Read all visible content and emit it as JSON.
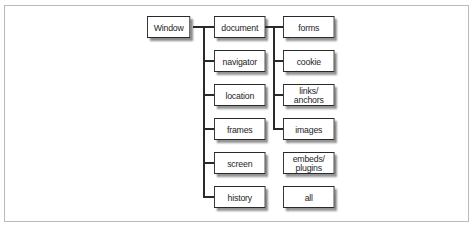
{
  "diagram": {
    "root": {
      "label": "Window"
    },
    "window_children": [
      {
        "label": "document"
      },
      {
        "label": "navigator"
      },
      {
        "label": "location"
      },
      {
        "label": "frames"
      },
      {
        "label": "screen"
      },
      {
        "label": "history"
      }
    ],
    "document_children": [
      {
        "label": "forms",
        "connected": true
      },
      {
        "label": "cookie",
        "connected": true
      },
      {
        "label": "links/\nanchors",
        "line1": "links/",
        "line2": "anchors",
        "connected": true
      },
      {
        "label": "images",
        "connected": true
      },
      {
        "label": "embeds/\nplugins",
        "line1": "embeds/",
        "line2": "plugins",
        "connected": false
      },
      {
        "label": "all",
        "connected": false
      }
    ],
    "colors": {
      "line": "#2a2a2a",
      "shadow": "#8c8c8c",
      "frame_border": "#b9b9b9",
      "background": "#ffffff"
    }
  }
}
